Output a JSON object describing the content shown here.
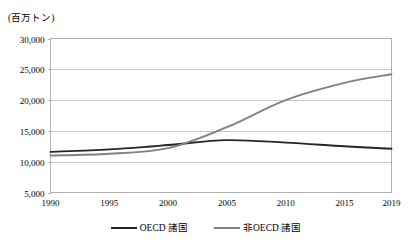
{
  "chart_data": {
    "type": "line",
    "title": "",
    "subtitle": "",
    "xlabel": "",
    "ylabel": "(百万トン)",
    "unit_label": "(百万トン)",
    "grid": true,
    "legend_position": "bottom",
    "xlim": [
      1990,
      2019
    ],
    "ylim": [
      5000,
      30000
    ],
    "ytick_step": 5000,
    "x": [
      1990,
      1995,
      2000,
      2005,
      2010,
      2015,
      2019
    ],
    "categories": [
      "1990",
      "1995",
      "2000",
      "2005",
      "2010",
      "2015",
      "2019"
    ],
    "xtick_labels": [
      "1990",
      "1995",
      "2000",
      "2005",
      "2010",
      "2015",
      "2019"
    ],
    "ytick_labels": [
      "30,000",
      "25,000",
      "20,000",
      "15,000",
      "10,000",
      "5,000"
    ],
    "ytick_values": [
      30000,
      25000,
      20000,
      15000,
      10000,
      5000
    ],
    "series": [
      {
        "name": "OECD 諸国",
        "color": "#262626",
        "values": [
          11600,
          12000,
          12700,
          13500,
          13100,
          12500,
          12100
        ]
      },
      {
        "name": "非OECD 諸国",
        "color": "#808080",
        "values": [
          11000,
          11300,
          12200,
          15600,
          20000,
          22800,
          24200
        ]
      }
    ]
  },
  "legend": {
    "entries": [
      {
        "label": "OECD 諸国",
        "color": "#262626"
      },
      {
        "label": "非OECD 諸国",
        "color": "#808080"
      }
    ]
  }
}
